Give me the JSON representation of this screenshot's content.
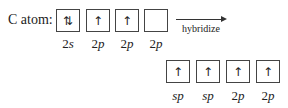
{
  "title": "C atom:",
  "ground_state": {
    "orbitals": [
      {
        "spin": "⇅",
        "label_num": "2",
        "label_sub": "s"
      },
      {
        "spin": "↑",
        "label_num": "2",
        "label_sub": "p"
      },
      {
        "spin": "↑",
        "label_num": "2",
        "label_sub": "p"
      },
      {
        "spin": "",
        "label_num": "2",
        "label_sub": "p"
      }
    ]
  },
  "arrow": {
    "label": "hybridize"
  },
  "hybridized_state": {
    "orbitals": [
      {
        "spin": "↑",
        "label_num": "",
        "label_sub": "sp"
      },
      {
        "spin": "↑",
        "label_num": "",
        "label_sub": "sp"
      },
      {
        "spin": "↑",
        "label_num": "2",
        "label_sub": "p"
      },
      {
        "spin": "↑",
        "label_num": "2",
        "label_sub": "p"
      }
    ]
  }
}
